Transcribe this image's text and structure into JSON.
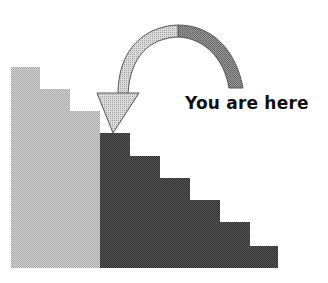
{
  "diagram": {
    "type": "staircase-progress",
    "label": "You are here",
    "colors": {
      "completed_steps": "#bdbdbd",
      "remaining_steps": "#4a4a4a",
      "arrow_fill_light": "#c8c8c8",
      "arrow_fill_dark": "#8a8a8a",
      "arrow_stroke": "#555555",
      "text": "#111111"
    },
    "completed_steps": [
      {
        "x": 11,
        "top": 67,
        "width": 30
      },
      {
        "x": 40,
        "top": 89,
        "width": 30
      },
      {
        "x": 70,
        "top": 111,
        "width": 30
      }
    ],
    "remaining_steps": [
      {
        "x": 100,
        "top": 133,
        "width": 30
      },
      {
        "x": 130,
        "top": 156,
        "width": 30
      },
      {
        "x": 160,
        "top": 178,
        "width": 30
      },
      {
        "x": 190,
        "top": 200,
        "width": 30
      },
      {
        "x": 220,
        "top": 222,
        "width": 30
      },
      {
        "x": 250,
        "top": 246,
        "width": 28
      }
    ],
    "baseline_y": 268
  }
}
